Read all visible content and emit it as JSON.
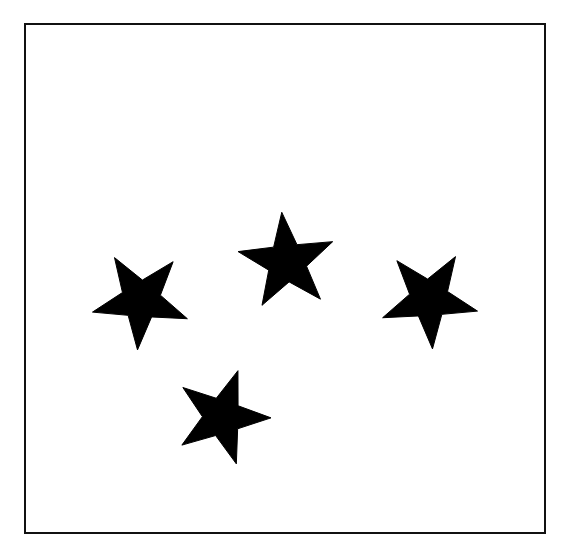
{
  "figure": {
    "background_color": "#ffffff",
    "frame": {
      "name": "rectangular-border",
      "stroke_color": "#111111",
      "stroke_width_px": 2,
      "fill_color": "#ffffff",
      "x": 24,
      "y": 23,
      "width": 522,
      "height": 511
    },
    "shape_count": 4,
    "shape_type": "star",
    "shape_color": "#000000",
    "caption_ghost": "",
    "stars": [
      {
        "id": "star-left",
        "label": "left star",
        "center_x": 141,
        "center_y": 300,
        "radius": 50,
        "rotation_deg": -104,
        "points": 5,
        "inner_ratio": 0.4,
        "color": "#000000"
      },
      {
        "id": "star-top",
        "label": "top star",
        "center_x": 287,
        "center_y": 262,
        "radius": 50,
        "rotation_deg": -6,
        "points": 5,
        "inner_ratio": 0.4,
        "color": "#000000"
      },
      {
        "id": "star-right",
        "label": "right star",
        "center_x": 429,
        "center_y": 299,
        "radius": 50,
        "rotation_deg": 32,
        "points": 5,
        "inner_ratio": 0.4,
        "color": "#000000"
      },
      {
        "id": "star-bottom",
        "label": "bottom star",
        "center_x": 222,
        "center_y": 417,
        "radius": 49,
        "rotation_deg": 19,
        "points": 5,
        "inner_ratio": 0.4,
        "color": "#000000"
      }
    ]
  }
}
